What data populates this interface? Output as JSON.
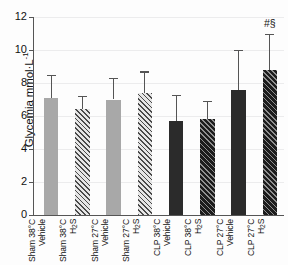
{
  "chart_data": {
    "type": "bar",
    "title": "",
    "xlabel": "",
    "ylabel": "Glycemia mmol·L",
    "ylabel_exponent": "-1",
    "ylim": [
      0,
      12
    ],
    "yticks": [
      0,
      2,
      4,
      6,
      8,
      10,
      12
    ],
    "ytick_labels": [
      "0",
      "2",
      "4",
      "6",
      "8",
      "10",
      "12"
    ],
    "grid": true,
    "legend": "none",
    "categories": [
      "Sham 38°C Vehicle",
      "Sham 38°C H2S",
      "Sham 27°C Vehicle",
      "Sham 27°C H2S",
      "CLP 38°C Vehicle",
      "CLP 38°C H2S",
      "CLP 27°C Vehicle",
      "CLP 27°C H2S"
    ],
    "category_lines": [
      [
        "Sham 38°C",
        "Vehicle"
      ],
      [
        "Sham 38°C",
        "H",
        "2",
        "S"
      ],
      [
        "Sham 27°C",
        "Vehicle"
      ],
      [
        "Sham 27°C",
        "H",
        "2",
        "S"
      ],
      [
        "CLP 38°C",
        "Vehicle"
      ],
      [
        "CLP 38°C",
        "H",
        "2",
        "S"
      ],
      [
        "CLP 27°C",
        "Vehicle"
      ],
      [
        "CLP 27°C",
        "H",
        "2",
        "S"
      ]
    ],
    "values": [
      7.1,
      6.4,
      7.0,
      7.4,
      5.7,
      5.8,
      7.6,
      8.8
    ],
    "errors_upper": [
      8.5,
      7.2,
      8.3,
      8.7,
      7.3,
      6.9,
      10.0,
      11.0
    ],
    "fills": [
      "solid-gray",
      "hatch-gray",
      "solid-gray",
      "hatch-gray",
      "solid-dark",
      "hatch-dark",
      "solid-dark",
      "hatch-dark"
    ],
    "annotations": [
      {
        "text": "#§",
        "category_index": 7,
        "value": 11.6
      }
    ],
    "colors": {
      "bar_gray": "#a8a8a8",
      "bar_dark": "#2b2b2b",
      "axis": "#555555",
      "grid": "#ececed",
      "text": "#111111"
    }
  }
}
